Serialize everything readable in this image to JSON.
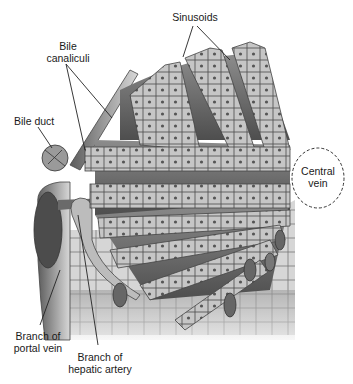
{
  "diagram": {
    "type": "anatomical-illustration",
    "labels": {
      "sinusoids": "Sinusoids",
      "bile_canaliculi": "Bile\ncanaliculi",
      "bile_duct": "Bile duct",
      "central_vein": "Central\nvein",
      "portal_vein": "Branch of\nportal vein",
      "hepatic_artery": "Branch of\nhepatic artery"
    },
    "colors": {
      "cell_fill": "#c4c4c4",
      "cell_stroke": "#4a4a4a",
      "nucleus": "#5a5a5a",
      "sinusoid_dark": "#6e6e6e",
      "vessel": "#8a8a8a",
      "background": "#ffffff"
    }
  }
}
